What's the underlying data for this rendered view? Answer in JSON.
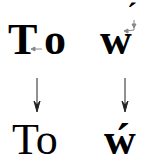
{
  "diagram": {
    "before": {
      "left_T": "T",
      "left_o": "o",
      "right_w": "w",
      "right_accent": "´"
    },
    "after": {
      "left": "To",
      "right": "ẃ"
    },
    "colors": {
      "text": "#000000",
      "arrow_main": "#222222",
      "arrow_adjust": "#888888"
    }
  }
}
